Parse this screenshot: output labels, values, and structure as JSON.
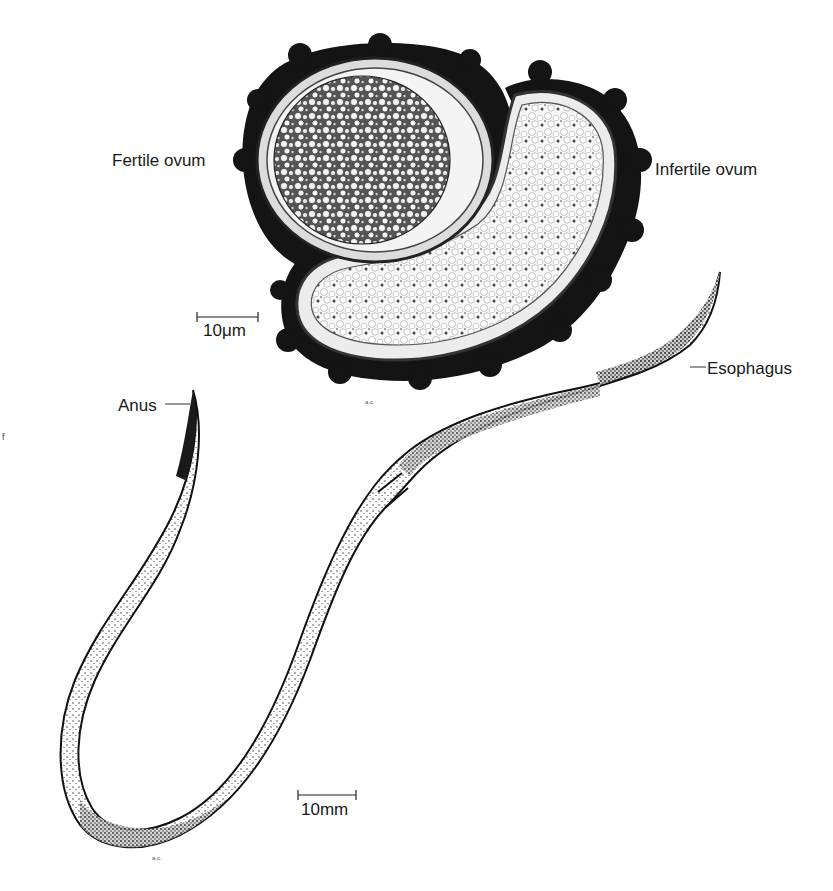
{
  "figure": {
    "labels": {
      "fertile_ovum": "Fertile ovum",
      "infertile_ovum": "Infertile ovum",
      "anus": "Anus",
      "esophagus": "Esophagus"
    },
    "scale_bars": {
      "ova": "10μm",
      "worm": "10mm"
    },
    "colors": {
      "ink": "#111111",
      "shell_dark": "#141414",
      "body_fill": "#f4f4f2",
      "background": "#ffffff"
    }
  }
}
